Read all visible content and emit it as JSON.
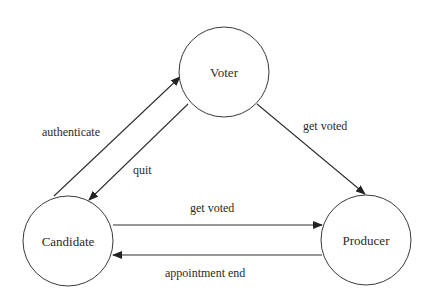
{
  "diagram": {
    "type": "state-transition",
    "colors": {
      "stroke": "#3a3a3a",
      "text": "#2a2a2a",
      "background": "#ffffff"
    },
    "nodes": [
      {
        "id": "voter",
        "label": "Voter",
        "cx": 224,
        "cy": 72,
        "r": 45
      },
      {
        "id": "candidate",
        "label": "Candidate",
        "cx": 68,
        "cy": 241,
        "r": 45
      },
      {
        "id": "producer",
        "label": "Producer",
        "cx": 366,
        "cy": 240,
        "r": 45
      }
    ],
    "edges": [
      {
        "id": "authenticate",
        "from": "candidate",
        "to": "voter",
        "label": "authenticate",
        "x1": 54,
        "y1": 196,
        "x2": 180,
        "y2": 77,
        "lx": 42,
        "ly": 136
      },
      {
        "id": "quit",
        "from": "voter",
        "to": "candidate",
        "label": "quit",
        "x1": 188,
        "y1": 104,
        "x2": 89,
        "y2": 200,
        "lx": 133,
        "ly": 174
      },
      {
        "id": "get-voted-voter",
        "from": "voter",
        "to": "producer",
        "label": "get voted",
        "x1": 257,
        "y1": 104,
        "x2": 365,
        "y2": 194,
        "lx": 303,
        "ly": 130
      },
      {
        "id": "get-voted-candidate",
        "from": "candidate",
        "to": "producer",
        "label": "get voted",
        "x1": 113,
        "y1": 225,
        "x2": 322,
        "y2": 225,
        "lx": 190,
        "ly": 212
      },
      {
        "id": "appointment-end",
        "from": "producer",
        "to": "candidate",
        "label": "appointment end",
        "x1": 322,
        "y1": 255,
        "x2": 113,
        "y2": 255,
        "lx": 165,
        "ly": 277
      }
    ]
  }
}
